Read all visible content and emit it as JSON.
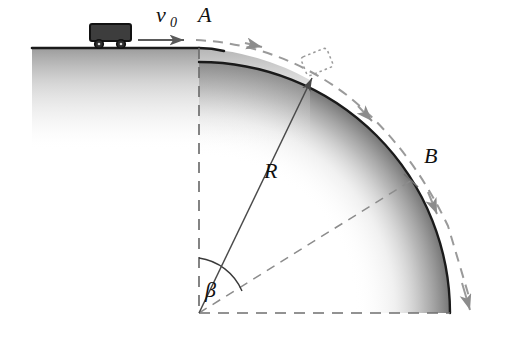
{
  "figure": {
    "background_color": "#ffffff"
  },
  "labels": {
    "velocity_symbol": "v",
    "velocity_subscript": "0",
    "point_a": "A",
    "point_b": "B",
    "radius": "R",
    "angle": "β"
  },
  "colors": {
    "surface_line": "#1a1a1a",
    "shading_dark": "#7d7d7d",
    "dashed_gray": "#8c8c8c",
    "cart_body": "#3d3d3d",
    "cart_outline": "#1a1a1a",
    "wheel": "#2b2b2b",
    "radius_line": "#4a4a4a",
    "text": "#101010"
  },
  "geometry": {
    "center_x": 199,
    "center_y": 313,
    "radius_px": 251,
    "ground_left_x": 32,
    "ground_y": 48,
    "arc_start_deg": 90,
    "arc_end_deg": 0,
    "beta_deg": 52,
    "point_b_deg": 32
  },
  "elements": {
    "ground_line": "horizontal-ground-surface",
    "curve": "circular-hill-surface",
    "cart": "cart-on-track",
    "velocity_arrow": "initial-velocity-arrow",
    "trajectory": "dashed-projectile-trajectory",
    "vertical_radius": "dashed-vertical-radius",
    "horizontal_radius": "dashed-horizontal-radius",
    "radius_to_b": "dashed-radius-to-point-b",
    "radius_line": "solid-radius-line-R",
    "angle_arc": "beta-angle-arc",
    "particle": "dotted-particle-outline",
    "tick_b": "tick-mark-at-b"
  }
}
